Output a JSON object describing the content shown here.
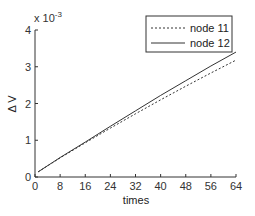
{
  "chart_data": {
    "type": "line",
    "title": "",
    "xlabel": "times",
    "ylabel": "Δ V",
    "y_multiplier": "x 10^-3",
    "y_multiplier_base": "x 10",
    "y_multiplier_exp": "-3",
    "xlim": [
      0,
      64
    ],
    "ylim": [
      0,
      4
    ],
    "xticks": [
      0,
      8,
      16,
      24,
      32,
      40,
      48,
      56,
      64
    ],
    "yticks": [
      0,
      1,
      2,
      3,
      4
    ],
    "grid": false,
    "legend_position": "upper right",
    "series": [
      {
        "name": "node 11",
        "style": "dashed",
        "x": [
          1,
          8,
          16,
          24,
          32,
          40,
          48,
          56,
          64
        ],
        "y": [
          0.14,
          0.52,
          0.93,
          1.33,
          1.72,
          2.1,
          2.47,
          2.83,
          3.18
        ]
      },
      {
        "name": "node 12",
        "style": "solid",
        "x": [
          1,
          8,
          16,
          24,
          32,
          40,
          48,
          56,
          64
        ],
        "y": [
          0.14,
          0.53,
          0.95,
          1.38,
          1.8,
          2.22,
          2.62,
          3.02,
          3.4
        ]
      }
    ]
  },
  "legend": {
    "entries": [
      "node 11",
      "node 12"
    ]
  }
}
